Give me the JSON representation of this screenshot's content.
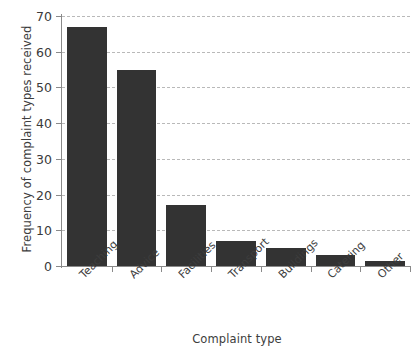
{
  "chart_data": {
    "type": "bar",
    "title": "",
    "xlabel": "Complaint type",
    "ylabel": "Frequency of complaint types received",
    "categories": [
      "Teaching",
      "Advice",
      "Facilities",
      "Transport",
      "Buildings",
      "Catering",
      "Other"
    ],
    "values": [
      67,
      55,
      17,
      7,
      5,
      3,
      1.5
    ],
    "ylim": [
      0,
      70
    ],
    "yticks": [
      0,
      10,
      20,
      30,
      40,
      50,
      60,
      70
    ],
    "ytick_labels": [
      "0",
      "10",
      "20",
      "30",
      "40",
      "50",
      "60",
      "70"
    ],
    "grid": "horizontal-dashed",
    "legend": "none",
    "bar_color": "#333333",
    "gridline_color": "#b9b9b9",
    "axis_color": "#8a8a8a",
    "background_color": "#ffffff"
  }
}
